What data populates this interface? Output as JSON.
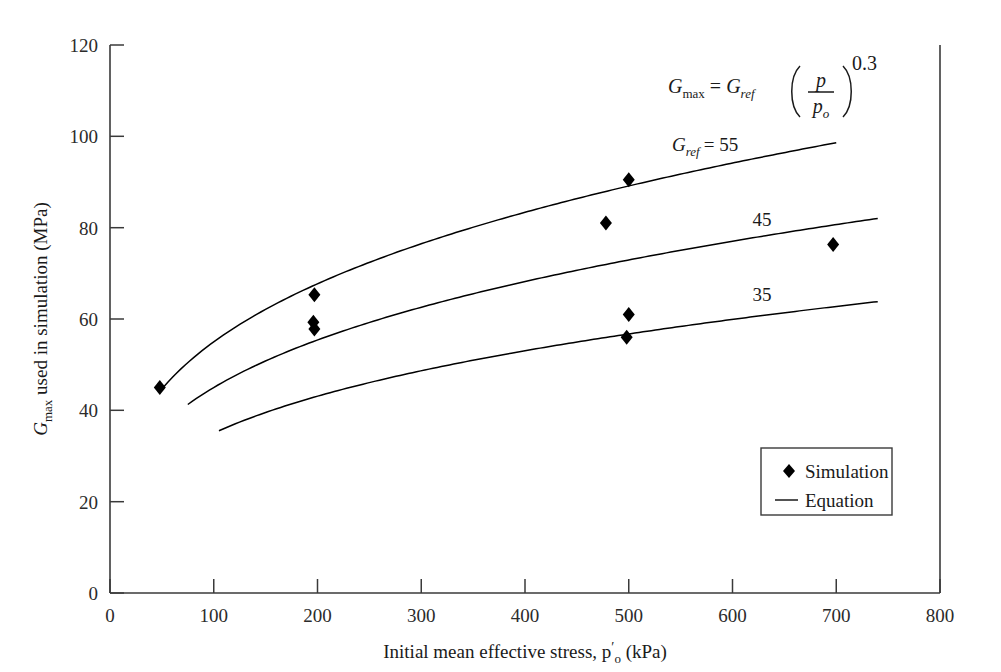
{
  "chart_data": {
    "type": "scatter",
    "title": "",
    "subtitle": "",
    "xlabel_parts": {
      "main": "Initial mean effective stress, p",
      "prime": "′",
      "sub": "o",
      "units": " (kPa)"
    },
    "xlabel": "Initial mean effective stress, p′o (kPa)",
    "ylabel_parts": {
      "g": "G",
      "sub": "max",
      "rest": " used in simulation (MPa)"
    },
    "ylabel": "Gmax used in simulation (MPa)",
    "xlim": [
      0,
      800
    ],
    "ylim": [
      0,
      120
    ],
    "xticks": [
      "0",
      "100",
      "200",
      "300",
      "400",
      "500",
      "600",
      "700",
      "800"
    ],
    "xtick_values": [
      0,
      100,
      200,
      300,
      400,
      500,
      600,
      700,
      800
    ],
    "yticks": [
      "0",
      "20",
      "40",
      "60",
      "80",
      "100",
      "120"
    ],
    "ytick_values": [
      0,
      20,
      40,
      60,
      80,
      100,
      120
    ],
    "grid": false,
    "legend_position": "lower-right",
    "series": [
      {
        "name": "Simulation",
        "type": "scatter",
        "marker": "diamond",
        "color": "#000000",
        "points": [
          {
            "x": 48,
            "y": 45.0
          },
          {
            "x": 197,
            "y": 65.3
          },
          {
            "x": 196,
            "y": 59.3
          },
          {
            "x": 197,
            "y": 57.8
          },
          {
            "x": 478,
            "y": 81.0
          },
          {
            "x": 500,
            "y": 90.5
          },
          {
            "x": 500,
            "y": 61.0
          },
          {
            "x": 498,
            "y": 56.0
          },
          {
            "x": 697,
            "y": 76.3
          }
        ]
      },
      {
        "name": "Equation",
        "type": "line",
        "color": "#000000",
        "equation": "G_max = G_ref (p/p_o)^0.3",
        "exponent": 0.3,
        "p_o": 100,
        "curves": [
          {
            "label": "55",
            "g_ref": 55,
            "x_start": 48,
            "x_end": 700,
            "label_x": 700,
            "label_y": 100
          },
          {
            "label": "45",
            "g_ref": 45,
            "x_start": 75,
            "x_end": 740,
            "label_x": 620,
            "label_y": 86
          },
          {
            "label": "35",
            "g_ref": 35,
            "x_start": 105,
            "x_end": 740,
            "label_x": 620,
            "label_y": 67
          }
        ]
      }
    ],
    "annotations": [
      {
        "name": "equation-annotation",
        "text": "Gmax = Gref (p/po)^0.3",
        "parts": {
          "g1": "G",
          "sub1": "max",
          "eq": "=",
          "g2": "G",
          "sub2": "ref",
          "num": "p",
          "den": "p",
          "densub": "o",
          "exp": "0.3"
        }
      },
      {
        "name": "curve-label-55",
        "text": "Gref = 55",
        "parts": {
          "g": "G",
          "sub": "ref",
          "eq": "= 55"
        }
      }
    ],
    "legend": {
      "entries": [
        {
          "label": "Simulation",
          "marker": "diamond"
        },
        {
          "label": "Equation",
          "marker": "line"
        }
      ]
    },
    "colors": {
      "ink": "#1a1a1a",
      "axis": "#3a3a3a",
      "marker": "#000000"
    }
  }
}
